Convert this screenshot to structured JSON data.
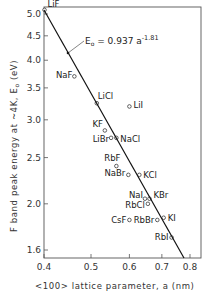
{
  "chart_data": {
    "type": "scatter",
    "title": "",
    "xlabel": "<100> lattice parameter, a (nm)",
    "ylabel": "F band peak energy at ~4K, E0 (eV)",
    "xscale": "log",
    "yscale": "log",
    "xlim": [
      0.4,
      0.85
    ],
    "ylim": [
      1.6,
      5.1
    ],
    "x_ticks": [
      0.4,
      0.5,
      0.6,
      0.7,
      0.8
    ],
    "x_tick_labels": [
      "0.4",
      "0.5",
      "0.6",
      "0.7",
      "0.8"
    ],
    "y_ticks": [
      1.6,
      2.0,
      2.5,
      3.0,
      3.5,
      4.0,
      4.5,
      5.0
    ],
    "y_tick_labels": [
      "1.6",
      "2.0",
      "2.5",
      "3.0",
      "3.5",
      "4.0",
      "4.5",
      "5.0"
    ],
    "grid": false,
    "annotation": {
      "text": "E0 = 0.937 a^-1.81",
      "coefficient": 0.937,
      "exponent": -1.81
    },
    "points": [
      {
        "label": "LiF",
        "x": 0.401,
        "y": 5.1
      },
      {
        "label": "NaF",
        "x": 0.462,
        "y": 3.7
      },
      {
        "label": "LiCl",
        "x": 0.514,
        "y": 3.25
      },
      {
        "label": "LiI",
        "x": 0.6,
        "y": 3.2
      },
      {
        "label": "KF",
        "x": 0.534,
        "y": 2.85
      },
      {
        "label": "LiBr",
        "x": 0.55,
        "y": 2.75
      },
      {
        "label": "NaCl",
        "x": 0.564,
        "y": 2.75
      },
      {
        "label": "RbF",
        "x": 0.564,
        "y": 2.4
      },
      {
        "label": "NaBr",
        "x": 0.597,
        "y": 2.3
      },
      {
        "label": "KCl",
        "x": 0.629,
        "y": 2.3
      },
      {
        "label": "NaI",
        "x": 0.646,
        "y": 2.05
      },
      {
        "label": "KBr",
        "x": 0.66,
        "y": 2.05
      },
      {
        "label": "RbCl",
        "x": 0.655,
        "y": 2.0
      },
      {
        "label": "CsF",
        "x": 0.6,
        "y": 1.85
      },
      {
        "label": "RbBr",
        "x": 0.685,
        "y": 1.85
      },
      {
        "label": "KI",
        "x": 0.706,
        "y": 1.87
      },
      {
        "label": "RbI",
        "x": 0.733,
        "y": 1.7
      }
    ]
  },
  "labels": {
    "xlabel": "<100> lattice parameter, a (nm)",
    "ylabel": "F band peak energy at ~4K, E",
    "ylabel_sub": "o",
    "ylabel_unit": " (eV)",
    "eq_main": "E",
    "eq_sub": "o",
    "eq_rest": " = 0.937  a",
    "eq_exp": "-1.81"
  }
}
